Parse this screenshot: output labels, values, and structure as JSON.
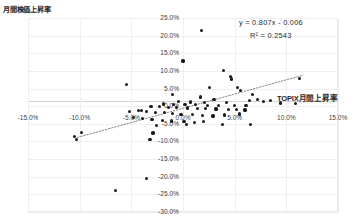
{
  "chart_data": {
    "type": "scatter",
    "title": "",
    "ylabel": "月間株価上昇率",
    "xlabel": "TOPIX月間上昇率",
    "xlim": [
      -15,
      15
    ],
    "ylim": [
      -30,
      25
    ],
    "grid": true,
    "legend": false,
    "xticks": [
      "-15.0%",
      "-10.0%",
      "-5.0%",
      "0.0%",
      "5.0%",
      "10.0%",
      "15.0%"
    ],
    "xtick_values": [
      -15,
      -10,
      -5,
      0,
      5,
      10,
      15
    ],
    "yticks": [
      "25.0%",
      "20.0%",
      "15.0%",
      "10.0%",
      "5.0%",
      "0.0%",
      "-5.0%",
      "-10.0%",
      "-15.0%",
      "-20.0%",
      "-25.0%",
      "-30.0%"
    ],
    "ytick_values": [
      25,
      20,
      15,
      10,
      5,
      0,
      -5,
      -10,
      -15,
      -20,
      -25,
      -30
    ],
    "annotations": {
      "equation": "y = 0.807x - 0.006",
      "r_squared": "R² = 0.2543"
    },
    "trendline": {
      "type": "linear",
      "slope": 0.807,
      "intercept": -0.6,
      "style": "dotted",
      "x_start": -10.2,
      "x_end": 11.6
    },
    "points": [
      [
        1.8,
        21.5
      ],
      [
        0.0,
        12.8
      ],
      [
        3.9,
        10.2
      ],
      [
        -5.5,
        6.2
      ],
      [
        4.6,
        8.4
      ],
      [
        4.7,
        7.7
      ],
      [
        11.3,
        7.9
      ],
      [
        2.6,
        5.2
      ],
      [
        5.3,
        5.2
      ],
      [
        5.6,
        4.4
      ],
      [
        -1.0,
        3.3
      ],
      [
        6.7,
        3.2
      ],
      [
        1.7,
        2.6
      ],
      [
        3.0,
        2.0
      ],
      [
        7.2,
        1.8
      ],
      [
        8.5,
        1.7
      ],
      [
        6.4,
        1.5
      ],
      [
        7.8,
        1.4
      ],
      [
        -0.4,
        1.3
      ],
      [
        0.7,
        1.2
      ],
      [
        2.1,
        1.1
      ],
      [
        4.2,
        1.0
      ],
      [
        -1.9,
        0.6
      ],
      [
        -0.9,
        0.5
      ],
      [
        0.2,
        0.5
      ],
      [
        1.2,
        0.4
      ],
      [
        2.4,
        0.3
      ],
      [
        3.4,
        0.2
      ],
      [
        5.0,
        0.2
      ],
      [
        6.1,
        0.3
      ],
      [
        9.4,
        0.9
      ],
      [
        10.9,
        0.8
      ],
      [
        -3.1,
        0.0
      ],
      [
        -2.3,
        -0.2
      ],
      [
        -1.4,
        -0.3
      ],
      [
        -0.6,
        -0.4
      ],
      [
        0.4,
        -0.5
      ],
      [
        1.4,
        -0.6
      ],
      [
        2.2,
        -0.7
      ],
      [
        3.2,
        -0.8
      ],
      [
        4.4,
        -0.9
      ],
      [
        5.2,
        -1.0
      ],
      [
        6.0,
        -1.1
      ],
      [
        -4.3,
        -1.3
      ],
      [
        -3.5,
        -1.5
      ],
      [
        -2.7,
        -1.7
      ],
      [
        -1.8,
        -1.9
      ],
      [
        -1.0,
        -2.1
      ],
      [
        -0.2,
        -2.3
      ],
      [
        0.9,
        -2.4
      ],
      [
        1.9,
        -2.6
      ],
      [
        2.9,
        -2.8
      ],
      [
        4.0,
        -2.5
      ],
      [
        5.5,
        -2.2
      ],
      [
        -4.8,
        -3.2
      ],
      [
        -3.9,
        -3.5
      ],
      [
        -3.0,
        -3.8
      ],
      [
        -2.0,
        -4.0
      ],
      [
        -1.1,
        -4.2
      ],
      [
        0.1,
        -4.4
      ],
      [
        1.1,
        -4.6
      ],
      [
        2.0,
        -4.3
      ],
      [
        -2.6,
        -5.4
      ],
      [
        0.3,
        -5.2
      ],
      [
        3.8,
        -5.1
      ],
      [
        6.5,
        -5.3
      ],
      [
        -4.0,
        -1.2
      ],
      [
        -5.2,
        -1.5
      ],
      [
        -2.9,
        -7.6
      ],
      [
        -3.2,
        -9.4
      ],
      [
        -9.8,
        -7.4
      ],
      [
        -10.5,
        -8.6
      ],
      [
        -10.3,
        -9.5
      ],
      [
        -3.5,
        -20.5
      ],
      [
        -6.5,
        -24.0
      ]
    ]
  }
}
